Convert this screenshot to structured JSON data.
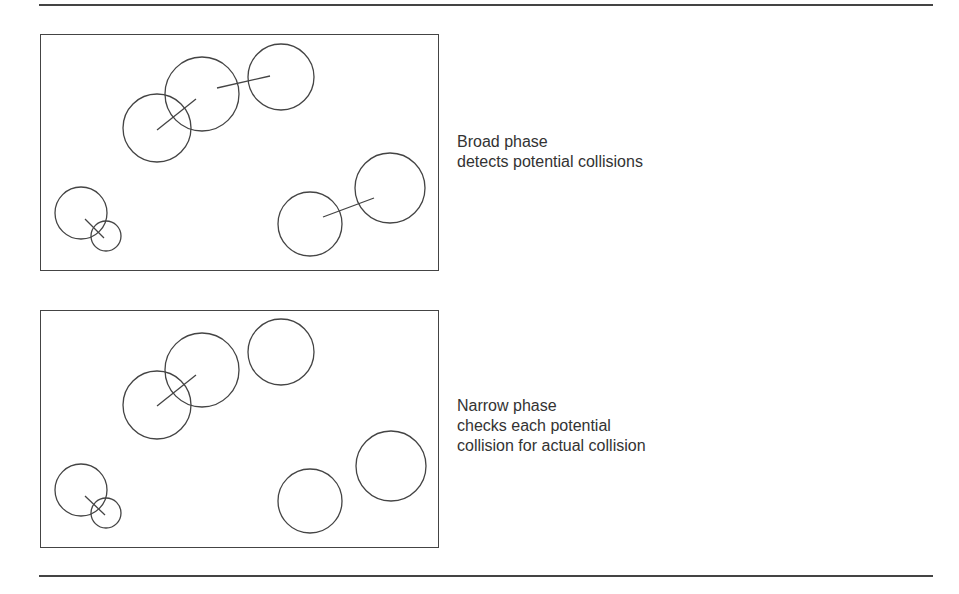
{
  "diagram": {
    "panels": [
      {
        "id": "broad-phase",
        "caption": [
          "Broad phase",
          "detects potential collisions"
        ],
        "circles": [
          {
            "cx": 116,
            "cy": 93,
            "r": 34
          },
          {
            "cx": 161,
            "cy": 59,
            "r": 37
          },
          {
            "cx": 240,
            "cy": 42,
            "r": 33
          },
          {
            "cx": 40,
            "cy": 178,
            "r": 26
          },
          {
            "cx": 65,
            "cy": 201,
            "r": 15
          },
          {
            "cx": 269,
            "cy": 189,
            "r": 32
          },
          {
            "cx": 349,
            "cy": 153,
            "r": 35
          }
        ],
        "links": [
          {
            "x1": 116,
            "y1": 95,
            "x2": 155,
            "y2": 64
          },
          {
            "x1": 176,
            "y1": 53,
            "x2": 229,
            "y2": 41
          },
          {
            "x1": 44,
            "y1": 184,
            "x2": 63,
            "y2": 203
          },
          {
            "x1": 282,
            "y1": 182,
            "x2": 333,
            "y2": 163
          }
        ]
      },
      {
        "id": "narrow-phase",
        "caption": [
          "Narrow phase",
          "checks each potential",
          "collision for actual collision"
        ],
        "circles": [
          {
            "cx": 116,
            "cy": 94,
            "r": 34
          },
          {
            "cx": 161,
            "cy": 59,
            "r": 37
          },
          {
            "cx": 240,
            "cy": 41,
            "r": 33
          },
          {
            "cx": 40,
            "cy": 179,
            "r": 26
          },
          {
            "cx": 65,
            "cy": 202,
            "r": 15
          },
          {
            "cx": 269,
            "cy": 190,
            "r": 32
          },
          {
            "cx": 350,
            "cy": 155,
            "r": 35
          }
        ],
        "links": [
          {
            "x1": 116,
            "y1": 95,
            "x2": 155,
            "y2": 64
          },
          {
            "x1": 44,
            "y1": 185,
            "x2": 64,
            "y2": 204
          }
        ]
      }
    ]
  }
}
